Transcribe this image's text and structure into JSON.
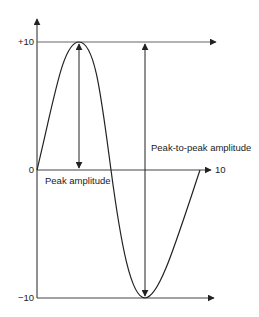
{
  "diagram": {
    "type": "sine-wave-amplitude",
    "y_axis": {
      "ticks": [
        {
          "label": "+10",
          "value": 10
        },
        {
          "label": "0",
          "value": 0
        },
        {
          "label": "−10",
          "value": -10
        }
      ]
    },
    "x_axis": {
      "end_label": "10"
    },
    "annotations": {
      "peak_amplitude": "Peak amplitude",
      "peak_to_peak_amplitude": "Peak-to-peak amplitude"
    },
    "colors": {
      "line": "#222222",
      "guide": "#777777",
      "background": "#ffffff"
    }
  }
}
